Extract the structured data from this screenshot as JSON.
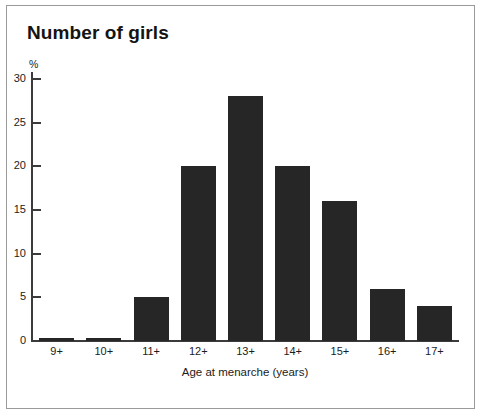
{
  "chart_data": {
    "type": "bar",
    "title": "Number of girls",
    "xlabel": "Age at menarche (years)",
    "ylabel": "%",
    "categories": [
      "9+",
      "10+",
      "11+",
      "12+",
      "13+",
      "14+",
      "15+",
      "16+",
      "17+"
    ],
    "values": [
      0.3,
      0.3,
      5,
      20,
      28,
      20,
      16,
      6,
      4
    ],
    "ylim": [
      0,
      30
    ],
    "yticks": [
      0,
      5,
      10,
      15,
      20,
      25,
      30
    ],
    "ytick_labels": [
      "0",
      "5",
      "10",
      "15",
      "20",
      "25",
      "30"
    ],
    "grid": false,
    "legend": false,
    "bar_color": "#262626",
    "axis_color": "#3b3b3b",
    "frame_color": "#9a9a9a",
    "background": "#ffffff"
  }
}
